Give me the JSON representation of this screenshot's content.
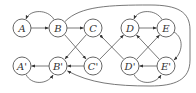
{
  "diagram": {
    "type": "directed-graph",
    "nodes": [
      {
        "id": "A",
        "label": "A",
        "x": 22,
        "y": 28
      },
      {
        "id": "B",
        "label": "B",
        "x": 58,
        "y": 28
      },
      {
        "id": "C",
        "label": "C",
        "x": 93,
        "y": 28
      },
      {
        "id": "D",
        "label": "D",
        "x": 130,
        "y": 28
      },
      {
        "id": "E",
        "label": "E",
        "x": 166,
        "y": 28
      },
      {
        "id": "A'",
        "label": "A'",
        "x": 22,
        "y": 66
      },
      {
        "id": "B'",
        "label": "B'",
        "x": 58,
        "y": 66
      },
      {
        "id": "C'",
        "label": "C'",
        "x": 93,
        "y": 66
      },
      {
        "id": "D'",
        "label": "D'",
        "x": 130,
        "y": 66
      },
      {
        "id": "E'",
        "label": "E'",
        "x": 166,
        "y": 66
      }
    ],
    "edges": [
      {
        "from": "A",
        "to": "B"
      },
      {
        "from": "B",
        "to": "A",
        "curved": "above"
      },
      {
        "from": "B",
        "to": "C"
      },
      {
        "from": "B",
        "to": "C'"
      },
      {
        "from": "C",
        "to": "B'"
      },
      {
        "from": "C'",
        "to": "B'"
      },
      {
        "from": "B'",
        "to": "A'"
      },
      {
        "from": "A'",
        "to": "B'",
        "curved": "below"
      },
      {
        "from": "C",
        "to": "D'"
      },
      {
        "from": "C'",
        "to": "D"
      },
      {
        "from": "D",
        "to": "E"
      },
      {
        "from": "E",
        "to": "D",
        "curved": "above"
      },
      {
        "from": "D'",
        "to": "E"
      },
      {
        "from": "E'",
        "to": "D"
      },
      {
        "from": "E'",
        "to": "D'"
      },
      {
        "from": "D'",
        "to": "E'",
        "curved": "below"
      },
      {
        "from": "E",
        "to": "E'",
        "curved": "right"
      },
      {
        "from": "B",
        "to": "B'",
        "curved": "outer loop around right side"
      }
    ]
  }
}
